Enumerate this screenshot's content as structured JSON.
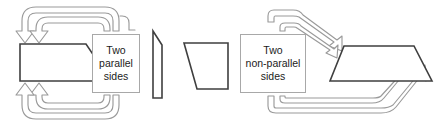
{
  "diagram": {
    "background_color": "#ffffff",
    "shape_stroke_color": "#3f3f3f",
    "arrow_stroke_color": "#9a9a9a",
    "text_color": "#1b1b1b"
  },
  "callouts": {
    "parallel": {
      "name": "two-parallel-sides",
      "line1": "Two",
      "line2": "parallel",
      "line3": "sides"
    },
    "nonparallel": {
      "name": "two-non-parallel-sides",
      "line1": "Two",
      "line2": "non-parallel",
      "line3": "sides"
    }
  },
  "shapes": [
    {
      "id": "right-trapezoid",
      "label": "right trapezoid",
      "points": "20,44 86,44 111,81 20,81"
    },
    {
      "id": "thin-quadrilateral",
      "label": "narrow quadrilateral",
      "points": "153,31 162,45 162,98 153,98"
    },
    {
      "id": "trapezoid-slanted-left",
      "label": "trapezoid with slanted left side",
      "points": "184,43 228,43 228,89 197,89"
    },
    {
      "id": "wide-trapezoid",
      "label": "wide trapezoid",
      "points": "344,46 414,46 432,81 330,81"
    }
  ],
  "arrows": [
    {
      "id": "top-left-outer-arrow",
      "label": "outer loop arrow into right trapezoid"
    },
    {
      "id": "top-left-inner-arrow",
      "label": "inner loop arrow into right trapezoid"
    },
    {
      "id": "bottom-left-outer-arrow",
      "label": "outer loop arrow back from callout"
    },
    {
      "id": "bottom-left-inner-arrow",
      "label": "inner loop arrow back from callout"
    },
    {
      "id": "top-right-outer-arrow",
      "label": "outer diagonal arrow into wide trapezoid"
    },
    {
      "id": "top-right-inner-arrow",
      "label": "inner diagonal arrow into wide trapezoid"
    },
    {
      "id": "bottom-right-outer-arrow",
      "label": "outer loop arrow up into wide trapezoid"
    },
    {
      "id": "bottom-right-inner-arrow",
      "label": "inner loop arrow up into wide trapezoid"
    }
  ]
}
